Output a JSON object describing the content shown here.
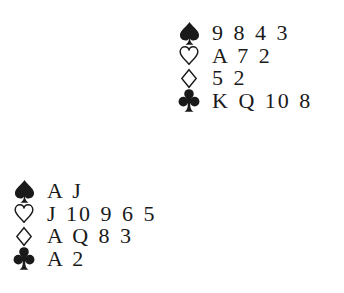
{
  "diagram": {
    "type": "bridge-hand-diagram",
    "hands": {
      "north": {
        "spades": "9 8 4 3",
        "hearts": "A 7 2",
        "diamonds": "5 2",
        "clubs": "K Q 10 8"
      },
      "west": {
        "spades": "A J",
        "hearts": "J 10 9 6 5",
        "diamonds": "A Q 8 3",
        "clubs": "A 2"
      }
    },
    "suit_icons": {
      "spades": "spade-icon",
      "hearts": "heart-outline-icon",
      "diamonds": "diamond-outline-icon",
      "clubs": "club-icon"
    },
    "colors": {
      "ink": "#1a1a1a",
      "background": "#ffffff"
    }
  }
}
